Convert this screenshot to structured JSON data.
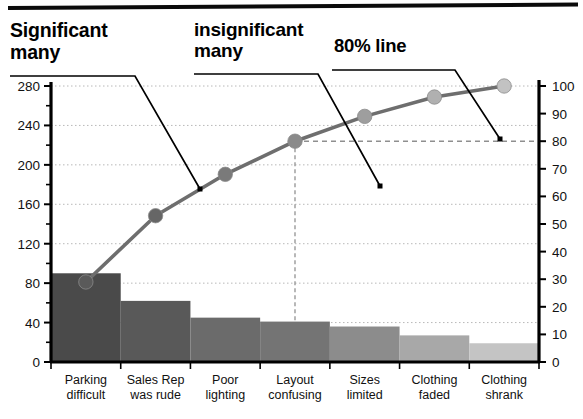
{
  "annotations": {
    "significant_many": "Significant\nmany",
    "insignificant_many": "insignificant\nmany",
    "eighty_line": "80% line"
  },
  "chart_data": {
    "type": "bar",
    "title": "",
    "subtitle": "",
    "xlabel": "",
    "ylabel": "",
    "y2label": "",
    "grid": true,
    "legend_position": "none",
    "categories": [
      "Parking difficult",
      "Sales Rep was rude",
      "Poor lighting",
      "Layout confusing",
      "Sizes limited",
      "Clothing faded",
      "Clothing shrank"
    ],
    "category_lines": [
      [
        "Parking",
        "difficult"
      ],
      [
        "Sales Rep",
        "was rude"
      ],
      [
        "Poor",
        "lighting"
      ],
      [
        "Layout",
        "confusing"
      ],
      [
        "Sizes",
        "limited"
      ],
      [
        "Clothing",
        "faded"
      ],
      [
        "Clothing",
        "shrank"
      ]
    ],
    "series": [
      {
        "name": "Count",
        "type": "bar",
        "axis": "left",
        "values": [
          90,
          62,
          45,
          41,
          36,
          27,
          19
        ]
      },
      {
        "name": "Cumulative %",
        "type": "line",
        "axis": "right",
        "values": [
          29,
          53,
          68,
          80,
          89,
          96,
          100
        ]
      }
    ],
    "ylim": [
      0,
      280
    ],
    "yticks": [
      0,
      40,
      80,
      120,
      160,
      200,
      240,
      280
    ],
    "ytick_labels": [
      "0",
      "40",
      "80",
      "120",
      "160",
      "200",
      "240",
      "280"
    ],
    "y_minor_step": 20,
    "y2lim": [
      0,
      100
    ],
    "y2ticks": [
      0,
      10,
      20,
      30,
      40,
      50,
      60,
      70,
      80,
      90,
      100
    ],
    "y2tick_labels": [
      "0",
      "10",
      "20",
      "30",
      "40",
      "50",
      "60",
      "70",
      "80",
      "90",
      "100"
    ],
    "threshold": {
      "value": 80,
      "category_index": 3,
      "style": "dashed"
    },
    "bar_colors": [
      "#4a4a4a",
      "#595959",
      "#6b6b6b",
      "#747474",
      "#8c8c8c",
      "#a8a8a8",
      "#c4c4c4"
    ],
    "marker_colors": [
      "#5a5a5a",
      "#666666",
      "#7a7a7a",
      "#8a8a8a",
      "#9e9e9e",
      "#b0b0b0",
      "#c2c2c2"
    ],
    "line_color": "#6e6e6e",
    "axis_color": "#000000",
    "grid_color": "#b8b8b8"
  }
}
